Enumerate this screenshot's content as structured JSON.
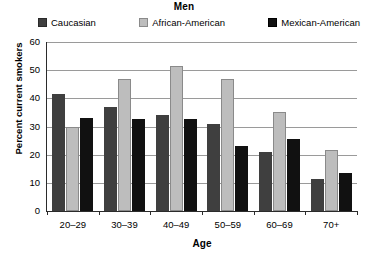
{
  "chart_data": {
    "type": "bar",
    "title": "Men",
    "xlabel": "Age",
    "ylabel": "Percent current smokers",
    "categories": [
      "20–29",
      "30–39",
      "40–49",
      "50–59",
      "60–69",
      "70+"
    ],
    "series": [
      {
        "name": "Caucasian",
        "color": "#3f3f3f",
        "values": [
          41.5,
          37,
          34,
          31,
          21,
          11.5
        ]
      },
      {
        "name": "African-American",
        "color": "#bdbdbd",
        "values": [
          30,
          47,
          51.5,
          47,
          35,
          21.5
        ]
      },
      {
        "name": "Mexican-American",
        "color": "#111111",
        "values": [
          33,
          32.5,
          32.5,
          23,
          25.5,
          13.5
        ]
      }
    ],
    "ylim": [
      0,
      60
    ],
    "yticks": [
      0,
      10,
      20,
      30,
      40,
      50,
      60
    ],
    "ytick_labels": [
      "0",
      "10",
      "20",
      "30",
      "40",
      "50",
      "60"
    ],
    "grid": true,
    "legend_position": "top"
  },
  "legend": {
    "items": [
      {
        "label": "Caucasian",
        "color": "#3f3f3f"
      },
      {
        "label": "African-American",
        "color": "#bdbdbd"
      },
      {
        "label": "Mexican-American",
        "color": "#111111"
      }
    ]
  }
}
